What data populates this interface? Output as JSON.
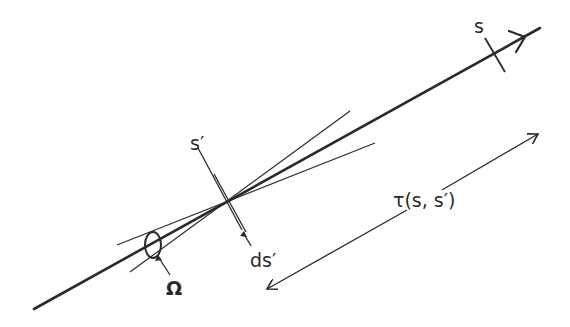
{
  "diagram": {
    "labels": {
      "s": "s",
      "s_prime": "s′",
      "ds_prime": "ds′",
      "omega": "Ω",
      "tau": "τ(s, s′)"
    },
    "colors": {
      "stroke": "#2a2a2a",
      "background": "#ffffff"
    }
  }
}
